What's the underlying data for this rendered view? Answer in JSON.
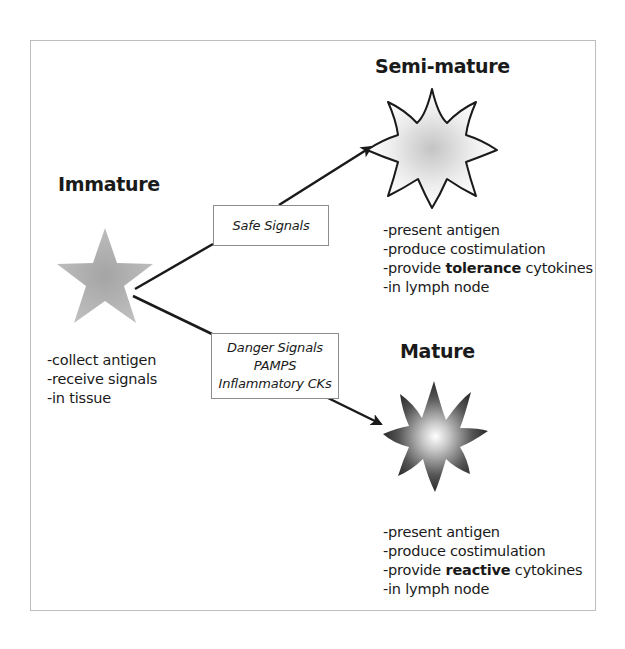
{
  "diagram": {
    "colors": {
      "frame_border": "#bdbdbd",
      "line": "#1a1a1a",
      "box_border": "#8c8c8c",
      "immature_star": "#a6a6a6",
      "semi_mature_fill_center": "#c8c8c8",
      "mature_fill_edge": "#2e2e2e",
      "mature_fill_center": "#ffffff"
    },
    "stages": {
      "immature": {
        "title": "Immature",
        "icon": "five-point-star-icon",
        "properties": [
          "-collect antigen",
          "-receive signals",
          "-in tissue"
        ]
      },
      "semi_mature": {
        "title": "Semi-mature",
        "icon": "outlined-ten-point-star-icon",
        "properties": [
          {
            "pre": "-present antigen",
            "bold": "",
            "post": ""
          },
          {
            "pre": "-produce costimulation",
            "bold": "",
            "post": ""
          },
          {
            "pre": "-provide ",
            "bold": "tolerance",
            "post": " cytokines"
          },
          {
            "pre": "-in lymph node",
            "bold": "",
            "post": ""
          }
        ]
      },
      "mature": {
        "title": "Mature",
        "icon": "gradient-ten-point-star-icon",
        "properties": [
          {
            "pre": "-present antigen",
            "bold": "",
            "post": ""
          },
          {
            "pre": "-produce costimulation",
            "bold": "",
            "post": ""
          },
          {
            "pre": "-provide ",
            "bold": "reactive",
            "post": " cytokines"
          },
          {
            "pre": "-in lymph node",
            "bold": "",
            "post": ""
          }
        ]
      }
    },
    "signals": {
      "safe": {
        "lines": [
          "Safe Signals"
        ]
      },
      "danger": {
        "lines": [
          "Danger Signals",
          "PAMPS",
          "Inflammatory CKs"
        ]
      }
    },
    "edges": [
      {
        "from": "Immature",
        "via": "Safe Signals",
        "to": "Semi-mature"
      },
      {
        "from": "Immature",
        "via": "Danger Signals / PAMPS / Inflammatory CKs",
        "to": "Mature"
      }
    ]
  }
}
